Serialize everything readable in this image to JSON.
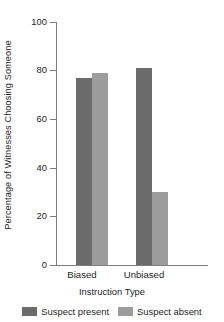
{
  "chart_data": {
    "type": "bar",
    "title": "",
    "xlabel": "Instruction Type",
    "ylabel": "Percentage of Witnesses Choosing Someone",
    "categories": [
      "Biased",
      "Unbiased"
    ],
    "series": [
      {
        "name": "Suspect present",
        "values": [
          77,
          81
        ],
        "color": "#6b6b6b"
      },
      {
        "name": "Suspect absent",
        "values": [
          79,
          30
        ],
        "color": "#9c9c9c"
      }
    ],
    "ylim": [
      0,
      100
    ],
    "yticks": [
      0,
      20,
      40,
      60,
      80,
      100
    ],
    "ytick_labels": [
      "0",
      "20",
      "40",
      "60",
      "80",
      "100"
    ],
    "grid": false,
    "legend_position": "bottom"
  },
  "axis": {
    "tick_0": "0",
    "tick_20": "20",
    "tick_40": "40",
    "tick_60": "60",
    "tick_80": "80",
    "tick_100": "100",
    "cat_1": "Biased",
    "cat_2": "Unbiased"
  },
  "legend": {
    "item_1": "Suspect present",
    "item_2": "Suspect absent"
  },
  "colors": {
    "series_dark": "#6b6b6b",
    "series_light": "#9c9c9c",
    "axis": "#7d7d7d",
    "text": "#1e1e1e",
    "background": "#ffffff"
  }
}
